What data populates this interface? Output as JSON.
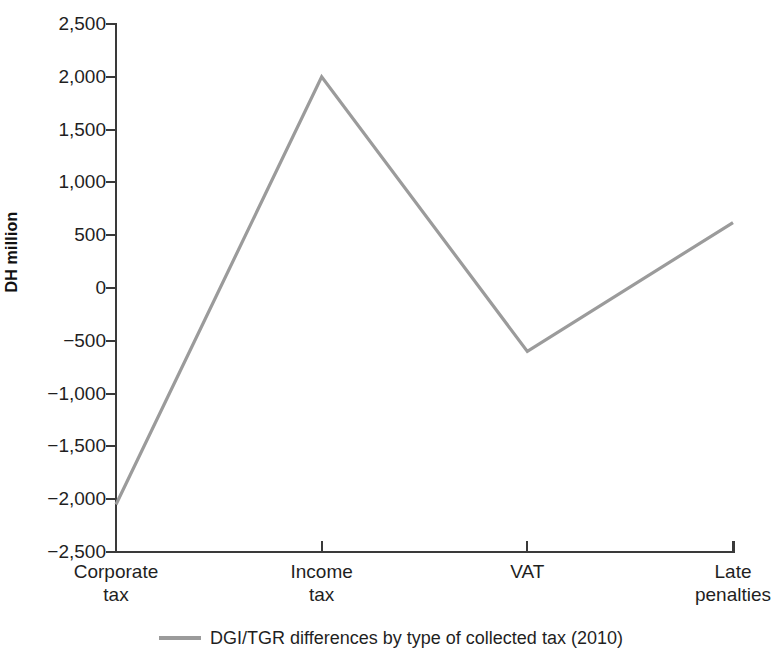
{
  "chart_data": {
    "type": "line",
    "title": "",
    "subtitle": "",
    "xlabel": "",
    "ylabel": "DH million",
    "categories": [
      "Corporate tax",
      "Income tax",
      "VAT",
      "Late penalties"
    ],
    "category_lines": [
      [
        "Corporate",
        "tax"
      ],
      [
        "Income",
        "tax"
      ],
      [
        "VAT",
        ""
      ],
      [
        "Late",
        "penalties"
      ]
    ],
    "series": [
      {
        "name": "DGI/TGR differences by type of collected tax (2010)",
        "values": [
          -2050,
          2000,
          -600,
          620
        ],
        "color": "#9b9b9b"
      }
    ],
    "ylim": [
      -2500,
      2500
    ],
    "ytick_values": [
      2500,
      2000,
      1500,
      1000,
      500,
      0,
      -500,
      -1000,
      -1500,
      -2000,
      -2500
    ],
    "ytick_labels": [
      "2,500",
      "2,000",
      "1,500",
      "1,000",
      "500",
      "0",
      "−500",
      "−1,000",
      "−1,500",
      "−2,000",
      "−2,500"
    ],
    "grid": false,
    "legend_position": "bottom"
  },
  "legend": {
    "entries": [
      {
        "label": "DGI/TGR differences by type of collected tax (2010)",
        "color": "#9b9b9b"
      }
    ]
  },
  "axes": {
    "y_title": "DH million",
    "axis_color": "#3a3a3a"
  }
}
